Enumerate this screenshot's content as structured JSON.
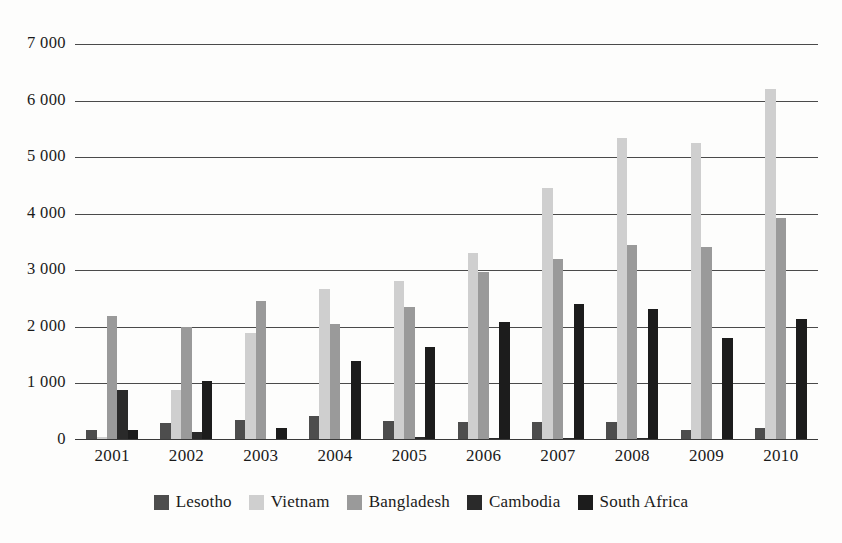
{
  "chart_data": {
    "type": "bar",
    "title": "",
    "subtitle": "",
    "xlabel": "",
    "ylabel": "",
    "categories": [
      "2001",
      "2002",
      "2003",
      "2004",
      "2005",
      "2006",
      "2007",
      "2008",
      "2009",
      "2010"
    ],
    "ylim": [
      0,
      7000
    ],
    "yticks": [
      0,
      1000,
      2000,
      3000,
      4000,
      5000,
      6000,
      7000
    ],
    "ytick_labels": [
      "0",
      "1 000",
      "2 000",
      "3 000",
      "4 000",
      "5 000",
      "6 000",
      "7 000"
    ],
    "grid": true,
    "legend_position": "bottom",
    "series": [
      {
        "name": "Lesotho",
        "color": "#4d4d4d",
        "values": [
          170,
          300,
          360,
          420,
          340,
          320,
          310,
          310,
          180,
          210
        ]
      },
      {
        "name": "Vietnam",
        "color": "#cfcfcf",
        "values": [
          60,
          880,
          1890,
          2670,
          2810,
          3300,
          4450,
          5330,
          5250,
          6200
        ]
      },
      {
        "name": "Bangladesh",
        "color": "#9a9a9a",
        "values": [
          2190,
          1990,
          2460,
          2050,
          2350,
          2970,
          3200,
          3440,
          3420,
          3930
        ]
      },
      {
        "name": "Cambodia",
        "color": "#2a2a2a",
        "values": [
          880,
          140,
          0,
          0,
          60,
          30,
          30,
          40,
          0,
          0
        ]
      },
      {
        "name": "South Africa",
        "color": "#1c1c1c",
        "values": [
          170,
          1050,
          210,
          1390,
          1650,
          2080,
          2400,
          2310,
          1800,
          2140
        ]
      }
    ]
  },
  "legend": {
    "items": [
      {
        "label": "Lesotho",
        "color": "#4d4d4d"
      },
      {
        "label": "Vietnam",
        "color": "#cfcfcf"
      },
      {
        "label": "Bangladesh",
        "color": "#9a9a9a"
      },
      {
        "label": "Cambodia",
        "color": "#2a2a2a"
      },
      {
        "label": "South Africa",
        "color": "#1c1c1c"
      }
    ]
  },
  "colors": {
    "gridline": "#4a4a4a",
    "axis": "#3a3a3a",
    "text": "#1a1a1a",
    "background": "#fdfdfc"
  }
}
